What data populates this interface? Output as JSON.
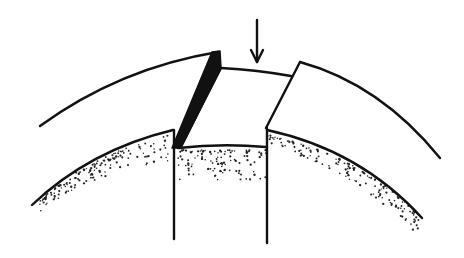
{
  "diagram": {
    "type": "line-drawing",
    "annotations": [
      {
        "kind": "arrow",
        "direction": "down",
        "label": ""
      }
    ],
    "colors": {
      "ink": "#111111",
      "background": "#ffffff",
      "stipple": "#222222"
    }
  }
}
